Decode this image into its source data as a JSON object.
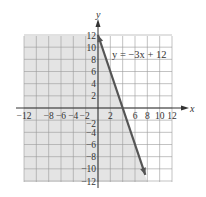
{
  "chart_data": {
    "type": "line",
    "title": "",
    "equation_label": "y = −3x + 12",
    "xlabel": "x",
    "ylabel": "y",
    "xlim": [
      -12,
      12
    ],
    "ylim": [
      -12,
      12
    ],
    "grid": true,
    "grid_step": 2,
    "x_tick_labels": [
      "−12",
      "−8",
      "−6",
      "−4",
      "−2",
      "2",
      "6",
      "8",
      "10",
      "12"
    ],
    "x_tick_values": [
      -12,
      -8,
      -6,
      -4,
      -2,
      2,
      6,
      8,
      10,
      12
    ],
    "y_tick_labels": [
      "12",
      "10",
      "8",
      "6",
      "4",
      "2",
      "−2",
      "−4",
      "−6",
      "−8",
      "−10",
      "−12"
    ],
    "y_tick_values": [
      12,
      10,
      8,
      6,
      4,
      2,
      -2,
      -4,
      -6,
      -8,
      -10,
      -12
    ],
    "series": [
      {
        "name": "y = −3x + 12",
        "slope": -3,
        "intercept": 12,
        "x": [
          0,
          4,
          7.67
        ],
        "y": [
          12,
          0,
          -11
        ],
        "color": "#555555",
        "arrows": "both"
      }
    ],
    "shaded_region": "left of line (−3x + 12 ≥ y side) shaded light gray",
    "colors": {
      "shade": "#e4e4e4",
      "grid": "#9a9a9a",
      "axis": "#333333",
      "line": "#555555"
    }
  }
}
